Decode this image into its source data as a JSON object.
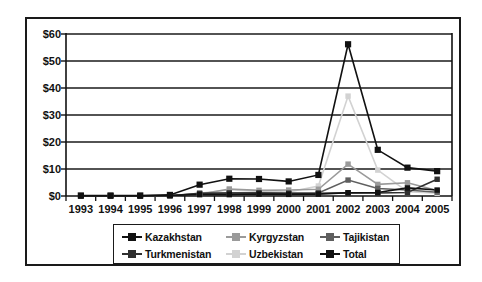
{
  "chart_data": {
    "type": "line",
    "title": "",
    "xlabel": "",
    "ylabel": "",
    "categories": [
      "1993",
      "1994",
      "1995",
      "1996",
      "1997",
      "1998",
      "1999",
      "2000",
      "2001",
      "2002",
      "2003",
      "2004",
      "2005"
    ],
    "ytick_labels": [
      "$0",
      "$10",
      "$20",
      "$30",
      "$40",
      "$50",
      "$60"
    ],
    "ytick_values": [
      0,
      10,
      20,
      30,
      40,
      50,
      60
    ],
    "ylim": [
      0,
      60
    ],
    "grid": "horizontal",
    "legend_position": "bottom-outside",
    "series": [
      {
        "name": "Kazakhstan",
        "color": "#111111",
        "values": [
          0.1,
          0.1,
          0.1,
          0.2,
          0.5,
          0.5,
          0.7,
          0.6,
          0.7,
          1.2,
          1.3,
          3.0,
          2.2
        ]
      },
      {
        "name": "Kyrgyzstan",
        "color": "#9a9a9a",
        "values": [
          0.05,
          0.05,
          0.05,
          0.1,
          0.6,
          2.6,
          2.1,
          2.2,
          2.5,
          11.8,
          4.3,
          4.9,
          2.0
        ]
      },
      {
        "name": "Tajikistan",
        "color": "#5f5f5f",
        "values": [
          0.05,
          0.05,
          0.05,
          0.1,
          0.9,
          1.1,
          1.2,
          1.0,
          1.1,
          5.9,
          2.8,
          2.2,
          1.4
        ]
      },
      {
        "name": "Turkmenistan",
        "color": "#2f2f2f",
        "values": [
          0.05,
          0.05,
          0.05,
          0.1,
          1.0,
          1.1,
          1.1,
          1.0,
          1.0,
          1.2,
          1.1,
          1.3,
          6.2
        ]
      },
      {
        "name": "Uzbekistan",
        "color": "#d2d2d2",
        "values": [
          0.05,
          0.05,
          0.05,
          0.1,
          1.0,
          2.3,
          1.7,
          1.5,
          3.7,
          37.0,
          9.6,
          1.6,
          1.0
        ]
      },
      {
        "name": "Total",
        "color": "#111111",
        "values": [
          0.2,
          0.2,
          0.2,
          0.4,
          4.2,
          6.4,
          6.3,
          5.4,
          7.8,
          56.2,
          17.1,
          10.5,
          9.2
        ]
      }
    ]
  },
  "legend": {
    "items": [
      {
        "label": "Kazakhstan",
        "color": "#111111"
      },
      {
        "label": "Kyrgyzstan",
        "color": "#9a9a9a"
      },
      {
        "label": "Tajikistan",
        "color": "#5f5f5f"
      },
      {
        "label": "Turkmenistan",
        "color": "#2f2f2f"
      },
      {
        "label": "Uzbekistan",
        "color": "#d2d2d2"
      },
      {
        "label": "Total",
        "color": "#111111"
      }
    ]
  }
}
